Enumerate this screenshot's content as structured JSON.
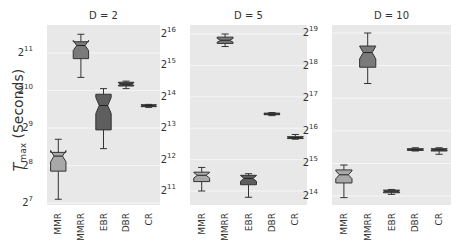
{
  "chart_data": [
    {
      "type": "box",
      "title": "D = 2",
      "ylabel": "T_max (Seconds)",
      "yscale": "log2",
      "yticks": [
        "2^7",
        "2^8",
        "2^9",
        "2^10",
        "2^11"
      ],
      "ylim_log2": [
        6.95,
        11.65
      ],
      "categories": [
        "MMR",
        "MMRR",
        "EBR",
        "DBR",
        "CR"
      ],
      "boxes_log2": [
        {
          "whislo": 7.1,
          "q1": 7.85,
          "med": 8.25,
          "q3": 8.35,
          "whishi": 8.7
        },
        {
          "whislo": 10.35,
          "q1": 10.85,
          "med": 11.2,
          "q3": 11.3,
          "whishi": 11.5
        },
        {
          "whislo": 8.45,
          "q1": 8.95,
          "med": 9.6,
          "q3": 9.9,
          "whishi": 10.05
        },
        {
          "whislo": 10.05,
          "q1": 10.12,
          "med": 10.17,
          "q3": 10.22,
          "whishi": 10.25
        },
        {
          "whislo": 9.55,
          "q1": 9.57,
          "med": 9.6,
          "q3": 9.62,
          "whishi": 9.63
        }
      ]
    },
    {
      "type": "box",
      "title": "D = 5",
      "yscale": "log2",
      "yticks": [
        "2^11",
        "2^12",
        "2^13",
        "2^14",
        "2^15",
        "2^16"
      ],
      "ylim_log2": [
        10.6,
        16.2
      ],
      "categories": [
        "MMR",
        "MMRR",
        "EBR",
        "DBR",
        "CR"
      ],
      "boxes_log2": [
        {
          "whislo": 11.0,
          "q1": 11.3,
          "med": 11.5,
          "q3": 11.6,
          "whishi": 11.75
        },
        {
          "whislo": 15.6,
          "q1": 15.7,
          "med": 15.8,
          "q3": 15.9,
          "whishi": 16.0
        },
        {
          "whislo": 10.8,
          "q1": 11.2,
          "med": 11.4,
          "q3": 11.5,
          "whishi": 11.55
        },
        {
          "whislo": 13.4,
          "q1": 13.43,
          "med": 13.45,
          "q3": 13.48,
          "whishi": 13.5
        },
        {
          "whislo": 12.65,
          "q1": 12.67,
          "med": 12.7,
          "q3": 12.73,
          "whishi": 12.8
        }
      ]
    },
    {
      "type": "box",
      "title": "D = 10",
      "yscale": "log2",
      "yticks": [
        "2^14",
        "2^15",
        "2^16",
        "2^17",
        "2^18",
        "2^19"
      ],
      "ylim_log2": [
        13.8,
        19.2
      ],
      "categories": [
        "MMR",
        "MMRR",
        "EBR",
        "DBR",
        "CR"
      ],
      "boxes_log2": [
        {
          "whislo": 13.95,
          "q1": 14.4,
          "med": 14.65,
          "q3": 14.8,
          "whishi": 14.95
        },
        {
          "whislo": 17.45,
          "q1": 17.95,
          "med": 18.4,
          "q3": 18.6,
          "whishi": 19.0
        },
        {
          "whislo": 14.05,
          "q1": 14.1,
          "med": 14.15,
          "q3": 14.18,
          "whishi": 14.2
        },
        {
          "whislo": 15.38,
          "q1": 15.4,
          "med": 15.42,
          "q3": 15.45,
          "whishi": 15.48
        },
        {
          "whislo": 15.28,
          "q1": 15.38,
          "med": 15.42,
          "q3": 15.45,
          "whishi": 15.48
        }
      ]
    }
  ],
  "labels": {
    "ylabel_main": "T",
    "ylabel_sub": "max",
    "ylabel_rest": " (Seconds)"
  },
  "colors": {
    "panel_bg": "#e8e8e8",
    "grid": "#f6f6f6",
    "fills": [
      "#a8a8a8",
      "#7a7a7a",
      "#5e5e5e",
      "#4a4a4a",
      "#555555"
    ]
  }
}
